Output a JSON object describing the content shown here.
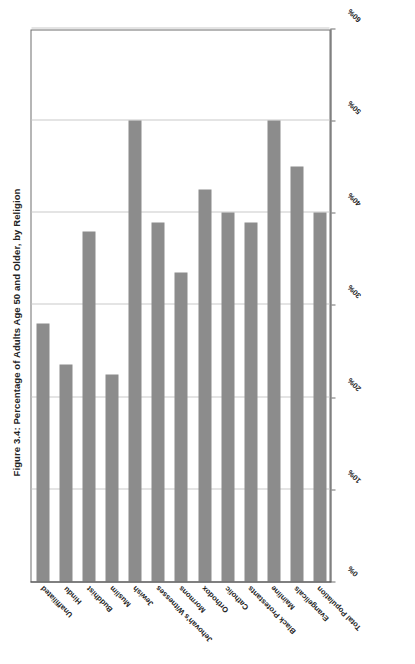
{
  "chart_data": {
    "type": "bar",
    "orientation": "horizontal",
    "title": "Figure 3.4: Percentage of Adults Age 50 and Older, by Religion",
    "xlabel": "",
    "ylabel": "",
    "xlim": [
      0,
      60
    ],
    "xticks": [
      "0%",
      "10%",
      "20%",
      "30%",
      "40%",
      "50%",
      "60%"
    ],
    "xtick_values": [
      0,
      10,
      20,
      30,
      40,
      50,
      60
    ],
    "grid": true,
    "legend": "none",
    "bar_color": "#8c8c8c",
    "axis_color": "#4a4a4a",
    "gridline_color": "#c9c9c9",
    "categories": [
      "Total Population",
      "Evangelicals",
      "Mainline",
      "Black Protestants",
      "Catholic",
      "Orthodox",
      "Mormons",
      "Jehovah's Witnesses",
      "Jewish",
      "Muslim",
      "Buddhist",
      "Hindu",
      "Unaffiliated"
    ],
    "values": [
      40,
      45,
      50,
      39,
      40,
      42.5,
      33.5,
      39,
      50,
      22.5,
      38,
      23.5,
      28
    ]
  }
}
